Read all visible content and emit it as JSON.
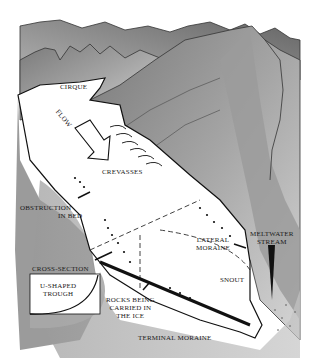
{
  "diagram": {
    "labels": {
      "cirque": "CIRQUE",
      "flow": "FLOW",
      "crevasses": "CREVASSES",
      "obstruction_line1": "OBSTRUCTION",
      "obstruction_line2": "IN BED",
      "lateral_line1": "LATERAL",
      "lateral_line2": "MORAINE",
      "meltwater_line1": "MELTWATER",
      "meltwater_line2": "STREAM",
      "cross_section": "CROSS-SECTION",
      "trough_line1": "U-SHAPED",
      "trough_line2": "TROUGH",
      "snout": "SNOUT",
      "rocks_line1": "ROCKS BEING",
      "rocks_line2": "CARRIED IN",
      "rocks_line3": "THE ICE",
      "terminal": "TERMINAL MORAINE"
    },
    "colors": {
      "ink": "#1a1a1a",
      "mountain_dark": "#6e6e6e",
      "mountain_mid": "#9a9a9a",
      "mountain_light": "#c8c8c8",
      "ice": "#ffffff",
      "ground": "#a8a8a8"
    }
  }
}
